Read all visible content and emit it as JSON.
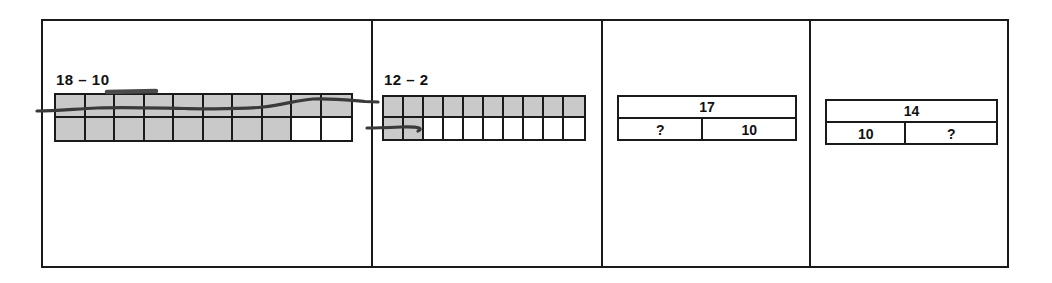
{
  "worksheet": {
    "panels": [
      {
        "id": "panel-1",
        "type": "ten-frame",
        "label": "18 – 10",
        "columns": 10,
        "rows": [
          {
            "name": "top-row",
            "shaded": 10,
            "total": 10
          },
          {
            "name": "bottom-row",
            "shaded": 8,
            "total": 10
          }
        ],
        "minuend": 18,
        "subtrahend": 10,
        "crossed_out_row": "top-row",
        "strike_mark": "horizontal-line-through-top-row"
      },
      {
        "id": "panel-2",
        "type": "ten-frame",
        "label": "12 – 2",
        "columns": 10,
        "rows": [
          {
            "name": "top-row",
            "shaded": 10,
            "total": 10
          },
          {
            "name": "bottom-row",
            "shaded": 2,
            "total": 10
          }
        ],
        "minuend": 12,
        "subtrahend": 2,
        "crossed_out_row": "bottom-row",
        "strike_mark": "short-line-through-first-two-bottom-cells"
      },
      {
        "id": "panel-3",
        "type": "bar-model",
        "whole": "17",
        "parts": [
          "?",
          "10"
        ],
        "unknown_position": "left"
      },
      {
        "id": "panel-4",
        "type": "bar-model",
        "whole": "14",
        "parts": [
          "10",
          "?"
        ],
        "unknown_position": "right"
      }
    ],
    "colors": {
      "ink": "#1a1a1a",
      "shaded_cell": "#c9c9c9",
      "empty_cell": "#ffffff",
      "paper": "#ffffff"
    }
  }
}
